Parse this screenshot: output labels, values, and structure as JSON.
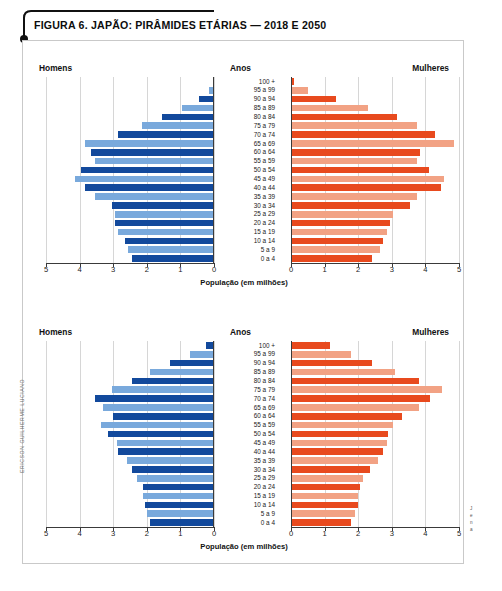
{
  "figure": {
    "title": "FIGURA 6. JAPÃO: PIRÂMIDES ETÁRIAS — 2018 E 2050",
    "credit": "ERICSON GUILHERME LUCIANO"
  },
  "side_caption": {
    "line1": "J",
    "line2": "e",
    "line3": "n",
    "line4": "a"
  },
  "labels": {
    "men": "Homens",
    "women": "Mulheres",
    "years": "Anos",
    "axis_caption": "População (em milhões)"
  },
  "colors": {
    "male_dark": "#12499C",
    "male_light": "#79A9DC",
    "female_dark": "#E84A1E",
    "female_light": "#F2A284",
    "grid": "#d6d6d6",
    "axis": "#3a3a3a"
  },
  "age_groups": [
    "100 +",
    "95 a 99",
    "90 a 94",
    "85 a 89",
    "80 a 84",
    "75 a 79",
    "70 a 74",
    "65 a 69",
    "60 a 64",
    "55 a 59",
    "50 a 54",
    "45 a 49",
    "40 a 44",
    "35 a 39",
    "30 a 34",
    "25 a 29",
    "20 a 24",
    "15 a 19",
    "10 a 14",
    "5 a 9",
    "0 a 4"
  ],
  "axis_ticks_left": [
    "5",
    "4",
    "3",
    "2",
    "1",
    "0"
  ],
  "axis_ticks_right": [
    "0",
    "1",
    "2",
    "3",
    "4",
    "5"
  ],
  "chart_data": [
    {
      "type": "bar",
      "subtype": "population-pyramid",
      "title": "Japão: pirâmide etária 2018",
      "year": 2018,
      "xlabel": "População (em milhões)",
      "ylabel": "Anos",
      "xlim": [
        0,
        5
      ],
      "grid": true,
      "legend": [
        "Homens",
        "Mulheres"
      ],
      "legend_position": "top-left-and-top-right",
      "categories": [
        "100 +",
        "95 a 99",
        "90 a 94",
        "85 a 89",
        "80 a 84",
        "75 a 79",
        "70 a 74",
        "65 a 69",
        "60 a 64",
        "55 a 59",
        "50 a 54",
        "45 a 49",
        "40 a 44",
        "35 a 39",
        "30 a 34",
        "25 a 29",
        "20 a 24",
        "15 a 19",
        "10 a 14",
        "5 a 9",
        "0 a 4"
      ],
      "series": [
        {
          "name": "Homens",
          "direction": "left",
          "values": [
            0.02,
            0.15,
            0.45,
            0.95,
            1.55,
            2.15,
            2.85,
            3.85,
            3.65,
            3.55,
            3.95,
            4.15,
            3.85,
            3.55,
            3.05,
            2.95,
            2.95,
            2.85,
            2.65,
            2.55,
            2.45
          ]
        },
        {
          "name": "Mulheres",
          "direction": "right",
          "values": [
            0.1,
            0.5,
            1.35,
            2.3,
            3.15,
            3.75,
            4.3,
            4.85,
            3.85,
            3.75,
            4.1,
            4.55,
            4.45,
            3.75,
            3.55,
            3.05,
            2.95,
            2.85,
            2.75,
            2.65,
            2.4
          ]
        }
      ]
    },
    {
      "type": "bar",
      "subtype": "population-pyramid",
      "title": "Japão: pirâmide etária 2050",
      "year": 2050,
      "xlabel": "População (em milhões)",
      "ylabel": "Anos",
      "xlim": [
        0,
        5
      ],
      "grid": true,
      "legend": [
        "Homens",
        "Mulheres"
      ],
      "legend_position": "top-left-and-top-right",
      "categories": [
        "100 +",
        "95 a 99",
        "90 a 94",
        "85 a 89",
        "80 a 84",
        "75 a 79",
        "70 a 74",
        "65 a 69",
        "60 a 64",
        "55 a 59",
        "50 a 54",
        "45 a 49",
        "40 a 44",
        "35 a 39",
        "30 a 34",
        "25 a 29",
        "20 a 24",
        "15 a 19",
        "10 a 14",
        "5 a 9",
        "0 a 4"
      ],
      "series": [
        {
          "name": "Homens",
          "direction": "left",
          "values": [
            0.25,
            0.7,
            1.3,
            1.9,
            2.45,
            3.05,
            3.55,
            3.3,
            3.0,
            3.35,
            3.15,
            2.9,
            2.85,
            2.6,
            2.45,
            2.3,
            2.1,
            2.1,
            2.05,
            2.0,
            1.9
          ]
        },
        {
          "name": "Mulheres",
          "direction": "right",
          "values": [
            1.15,
            1.8,
            2.4,
            3.1,
            3.8,
            4.5,
            4.15,
            3.8,
            3.3,
            3.05,
            2.9,
            2.85,
            2.75,
            2.6,
            2.35,
            2.15,
            2.05,
            2.0,
            2.0,
            1.9,
            1.8
          ]
        }
      ]
    }
  ]
}
